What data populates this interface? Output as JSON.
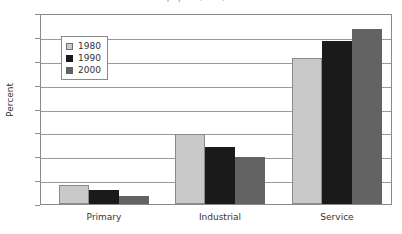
{
  "chart_data": {
    "type": "bar",
    "title": "...of total employment, 1980, 1990 and 2000",
    "xlabel": "",
    "ylabel": "Percent",
    "ylim": [
      0,
      80
    ],
    "yticks": [
      0,
      10,
      20,
      30,
      40,
      50,
      60,
      70,
      80
    ],
    "grid": true,
    "legend_position": "upper-left-inside",
    "categories": [
      "Primary",
      "Industrial",
      "Service"
    ],
    "series": [
      {
        "name": "1980",
        "color": "#c9c9c9",
        "values": [
          8,
          29.5,
          62
        ]
      },
      {
        "name": "1990",
        "color": "#1a1a1a",
        "values": [
          6,
          24,
          69
        ]
      },
      {
        "name": "2000",
        "color": "#636363",
        "values": [
          3.5,
          20,
          74
        ]
      }
    ]
  },
  "axis": {
    "y_title": "Percent",
    "y_labels": [
      "80",
      "70",
      "60",
      "50",
      "40",
      "30",
      "20",
      "10",
      "0"
    ],
    "x_labels": [
      "Primary",
      "Industrial",
      "Service"
    ]
  },
  "legend": {
    "items": [
      {
        "label": "1980"
      },
      {
        "label": "1990"
      },
      {
        "label": "2000"
      }
    ]
  }
}
